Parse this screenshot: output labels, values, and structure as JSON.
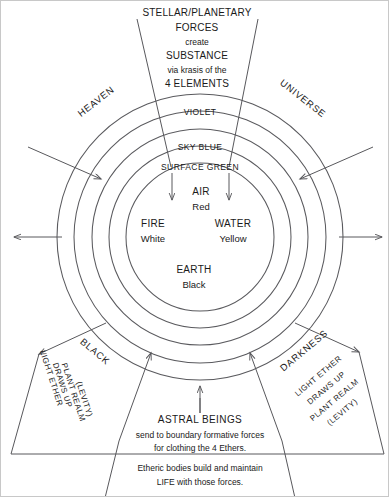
{
  "diagram": {
    "title_block": {
      "line1": "STELLAR/PLANETARY",
      "line2": "FORCES",
      "line3": "create",
      "line4": "SUBSTANCE",
      "line5": "via krasis of the",
      "line6": "4 ELEMENTS"
    },
    "corners": {
      "top_left": "HEAVEN",
      "top_right": "UNIVERSE",
      "bottom_left": "BLACK",
      "bottom_right": "DARKNESS"
    },
    "rings": [
      {
        "label": "VIOLET"
      },
      {
        "label": "SKY BLUE"
      },
      {
        "label": "SURFACE GREEN"
      }
    ],
    "elements": [
      {
        "name": "AIR",
        "color": "Red"
      },
      {
        "name": "FIRE",
        "color": "White"
      },
      {
        "name": "WATER",
        "color": "Yellow"
      },
      {
        "name": "EARTH",
        "color": "Black"
      }
    ],
    "side_notes": {
      "left": [
        "LIGHT ETHER",
        "DRAWS UP",
        "PLANT REALM",
        "(LEVITY)"
      ],
      "right": [
        "LIGHT ETHER",
        "DRAWS UP",
        "PLANT REALM",
        "(LEVITY)"
      ]
    },
    "bottom_block": {
      "line1": "ASTRAL BEINGS",
      "line2": "send to boundary formative forces",
      "line3": "for clothing the 4 Ethers.",
      "line4": "Etheric bodies build and maintain",
      "line5": "LIFE with those forces."
    },
    "colors": {
      "stroke": "#58585c",
      "text": "#1a1a1a",
      "background": "#ffffff"
    }
  }
}
